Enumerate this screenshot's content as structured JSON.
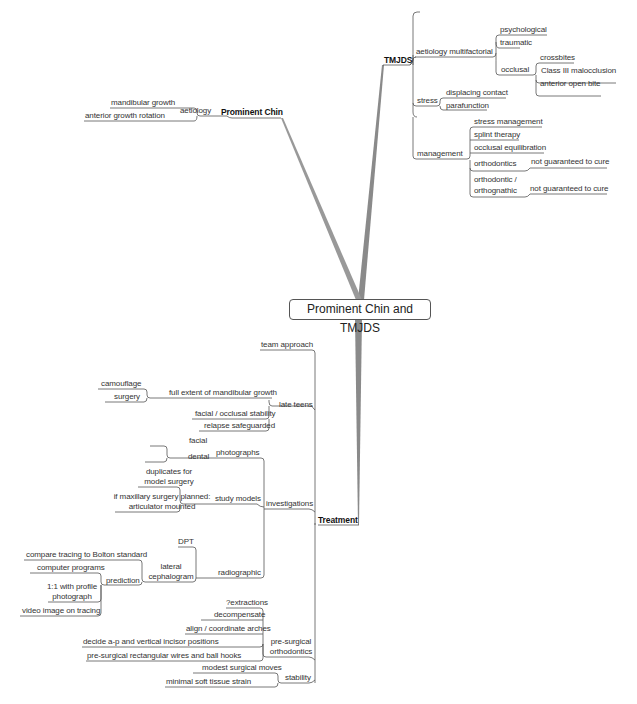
{
  "root": {
    "label": "Prominent Chin and TMJDS"
  },
  "branches": {
    "tmjds": {
      "label": "TMJDS",
      "aetiology": {
        "label": "aetiology multifactorial",
        "items": [
          "psychological",
          "traumatic"
        ],
        "occlusal": {
          "label": "occlusal",
          "items": [
            "crossbites",
            "Class III malocclusion",
            "anterior open bite"
          ]
        }
      },
      "stress": {
        "label": "stress",
        "items": [
          "displacing contact",
          "parafunction"
        ]
      },
      "management": {
        "label": "management",
        "items": [
          "stress management",
          "splint therapy",
          "occlusal equilibration"
        ],
        "orthodontics": {
          "label": "orthodontics",
          "note": "not guaranteed to cure"
        },
        "orthognathic": {
          "label_line1": "orthodontic /",
          "label_line2": "orthognathic",
          "note": "not guaranteed to cure"
        }
      }
    },
    "prominent_chin": {
      "label": "Prominent Chin",
      "aetiology": {
        "label": "aetiology",
        "items": [
          "mandibular growth",
          "anterior growth rotation"
        ]
      }
    },
    "treatment": {
      "label": "Treatment",
      "team_approach": "team approach",
      "late_teens": {
        "label": "late teens",
        "full_extent": "full extent of mandibular growth",
        "full_extent_children": [
          "camouflage",
          "surgery"
        ],
        "items": [
          "facial / occlusal stability",
          "relapse safeguarded"
        ]
      },
      "investigations": {
        "label": "investigations",
        "photographs": {
          "label": "photographs",
          "items": [
            "facial",
            "dental"
          ]
        },
        "study_models": {
          "label": "study models",
          "items": [
            {
              "line1": "duplicates for",
              "line2": "model surgery"
            },
            {
              "line1": "if maxillary surgery planned:",
              "line2": "articulator mounted"
            }
          ]
        },
        "radiographic": {
          "label": "radiographic",
          "dpt": "DPT",
          "lateral_ceph": {
            "line1": "lateral",
            "line2": "cephalogram",
            "items": [
              "compare tracing to Bolton standard"
            ],
            "prediction": {
              "label": "prediction",
              "items": [
                "computer programs"
              ],
              "photo": {
                "line1": "1:1 with profile",
                "line2": "photograph"
              },
              "video": "video image on tracing"
            }
          }
        }
      },
      "pre_surgical": {
        "line1": "pre-surgical",
        "line2": "orthodontics",
        "items": [
          "?extractions",
          "decompensate",
          "align / coordinate arches",
          "decide a-p and vertical incisor positions",
          "pre-surgical rectangular wires and ball hooks"
        ]
      },
      "stability": {
        "label": "stability",
        "items": [
          "modest surgical moves",
          "minimal soft tissue strain"
        ]
      }
    }
  },
  "colors": {
    "line": "#555555",
    "thick_branch": "#8a8a8a",
    "text": "#333333",
    "background": "#ffffff"
  }
}
